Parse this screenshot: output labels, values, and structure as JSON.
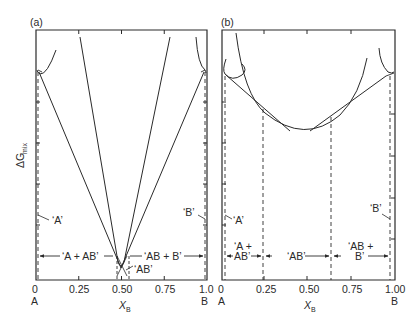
{
  "figure": {
    "y_axis_label": "ΔG",
    "y_axis_subscript": "mix",
    "x_axis_label": "X",
    "x_axis_subscript": "B"
  },
  "panels": [
    {
      "id": "a",
      "tag": "(a)",
      "x_ticks": [
        "0",
        "0.25",
        "0.50",
        "0.75",
        "1.0"
      ],
      "end_labels": {
        "left": "A",
        "right": "B"
      },
      "phase_labels": {
        "A_pure": "‘A’",
        "B_pure": "‘B’",
        "AB": "‘AB’",
        "A_plus_AB": "‘A + AB’",
        "AB_plus_B": "‘AB + B’"
      }
    },
    {
      "id": "b",
      "tag": "(b)",
      "x_ticks": [
        "0",
        "0.25",
        "0.50",
        "0.75",
        "1.00"
      ],
      "end_labels": {
        "left": "A",
        "right": "B"
      },
      "phase_labels": {
        "A_pure": "‘A’",
        "B_pure": "‘B’",
        "AB": "‘AB’",
        "A_plus_AB_line1": "‘A +",
        "A_plus_AB_line2": "AB’",
        "AB_plus_B_line1": "‘AB +",
        "AB_plus_B_line2": "B’"
      }
    }
  ],
  "colors": {
    "ink": "#2a2a2a",
    "background": "#ffffff"
  }
}
